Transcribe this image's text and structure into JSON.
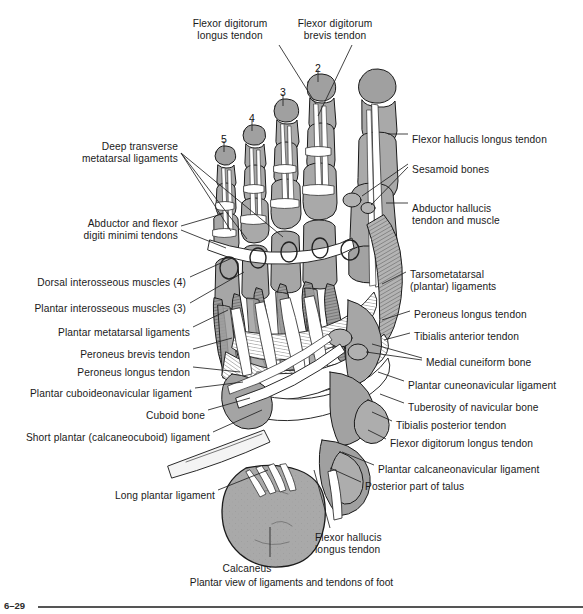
{
  "figure": {
    "number": "6–29",
    "caption": "Plantar view of ligaments and tendons of foot",
    "colors": {
      "background": "#ffffff",
      "bone_fill": "#a9a9a9",
      "bone_dark": "#8d8d8d",
      "tendon_fill": "#ffffff",
      "outline": "#1a1a1a",
      "leader_line": "#222222",
      "text": "#1a1a1a",
      "footer_rule": "#555555"
    }
  },
  "toe_numbers": [
    {
      "label": "2",
      "x": 318,
      "y": 62
    },
    {
      "label": "3",
      "x": 283,
      "y": 86
    },
    {
      "label": "4",
      "x": 252,
      "y": 112
    },
    {
      "label": "5",
      "x": 224,
      "y": 133
    }
  ],
  "labels_top": [
    {
      "id": "flexor-digitorum-longus-tendon-top",
      "text": "Flexor digitorum\nlongus tendon",
      "x": 230,
      "y": 18,
      "align": "center"
    },
    {
      "id": "flexor-digitorum-brevis-tendon-top",
      "text": "Flexor digitorum\nbrevis tendon",
      "x": 335,
      "y": 18,
      "align": "center"
    }
  ],
  "labels_left": [
    {
      "id": "deep-transverse-metatarsal-ligaments",
      "text": "Deep transverse\nmetatarsal ligaments",
      "x": 178,
      "y": 141
    },
    {
      "id": "abductor-and-flexor-digiti-minimi-tendons",
      "text": "Abductor and flexor\ndigiti minimi tendons",
      "x": 178,
      "y": 218
    },
    {
      "id": "dorsal-interosseous-muscles",
      "text": "Dorsal interosseous muscles (4)",
      "x": 186,
      "y": 277
    },
    {
      "id": "plantar-interosseous-muscles",
      "text": "Plantar interosseous muscles (3)",
      "x": 186,
      "y": 303
    },
    {
      "id": "plantar-metatarsal-ligaments",
      "text": "Plantar metatarsal ligaments",
      "x": 190,
      "y": 327
    },
    {
      "id": "peroneus-brevis-tendon",
      "text": "Peroneus brevis tendon",
      "x": 190,
      "y": 349
    },
    {
      "id": "peroneus-longus-tendon-left",
      "text": "Peroneus longus tendon",
      "x": 190,
      "y": 367
    },
    {
      "id": "plantar-cuboideonavicular-ligament",
      "text": "Plantar cuboideonavicular ligament",
      "x": 192,
      "y": 388
    },
    {
      "id": "cuboid-bone",
      "text": "Cuboid bone",
      "x": 205,
      "y": 410
    },
    {
      "id": "short-plantar-calcaneocuboid-ligament",
      "text": "Short plantar (calcaneocuboid) ligament",
      "x": 210,
      "y": 432
    },
    {
      "id": "long-plantar-ligament",
      "text": "Long plantar ligament",
      "x": 215,
      "y": 490
    }
  ],
  "labels_right": [
    {
      "id": "flexor-hallucis-longus-tendon-right",
      "text": "Flexor hallucis longus tendon",
      "x": 412,
      "y": 134
    },
    {
      "id": "sesamoid-bones",
      "text": "Sesamoid bones",
      "x": 412,
      "y": 164
    },
    {
      "id": "abductor-hallucis-tendon-and-muscle",
      "text": "Abductor hallucis\ntendon and muscle",
      "x": 412,
      "y": 203
    },
    {
      "id": "tarsometatarsal-plantar-ligaments",
      "text": "Tarsometatarsal\n(plantar) ligaments",
      "x": 410,
      "y": 269
    },
    {
      "id": "peroneus-longus-tendon-right",
      "text": "Peroneus longus tendon",
      "x": 414,
      "y": 309
    },
    {
      "id": "tibialis-anterior-tendon",
      "text": "Tibialis anterior tendon",
      "x": 414,
      "y": 331
    },
    {
      "id": "medial-cuneiform-bone",
      "text": "Medial cuneiform bone",
      "x": 426,
      "y": 357
    },
    {
      "id": "plantar-cuneonavicular-ligament",
      "text": "Plantar cuneonavicular ligament",
      "x": 408,
      "y": 380
    },
    {
      "id": "tuberosity-of-navicular-bone",
      "text": "Tuberosity of navicular bone",
      "x": 408,
      "y": 402
    },
    {
      "id": "tibialis-posterior-tendon",
      "text": "Tibialis posterior tendon",
      "x": 396,
      "y": 420
    },
    {
      "id": "flexor-digitorum-longus-tendon-right",
      "text": "Flexor digitorum longus tendon",
      "x": 390,
      "y": 438
    },
    {
      "id": "plantar-calcaneonavicular-ligament",
      "text": "Plantar calcaneonavicular ligament",
      "x": 378,
      "y": 464
    },
    {
      "id": "posterior-part-of-talus",
      "text": "Posterior part of talus",
      "x": 365,
      "y": 481
    }
  ],
  "labels_bottom": [
    {
      "id": "flexor-hallucis-longus-tendon-bottom",
      "text": "Flexor hallucis\nlongus tendon",
      "x": 315,
      "y": 532
    },
    {
      "id": "calcaneus",
      "text": "Calcaneus",
      "x": 247,
      "y": 563,
      "align": "center"
    }
  ]
}
